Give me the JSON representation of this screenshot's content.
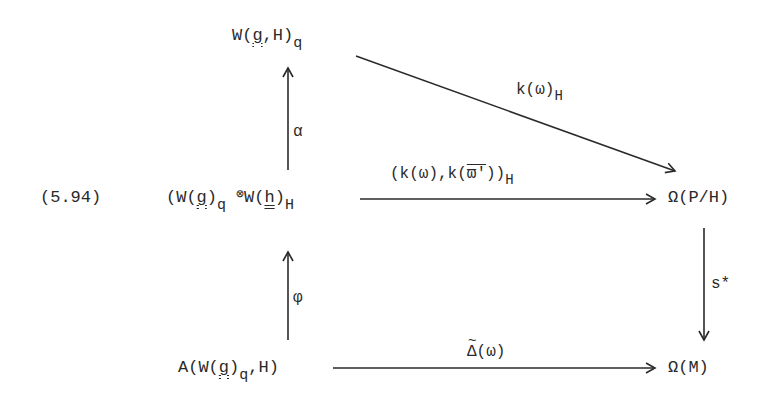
{
  "equation_number": "(5.94)",
  "nodes": {
    "top": {
      "main": "W(",
      "g": "g",
      "rest": ",H)",
      "sub": "q"
    },
    "middle_left": {
      "open": "(W(",
      "g": "g",
      "close1": ")",
      "sub1": "q",
      "tensor": "⊗",
      "w2": "W(",
      "h": "h",
      "close2": ")",
      "sub2": "H"
    },
    "middle_right": {
      "text": "Ω(P/H)"
    },
    "bottom_left": {
      "open": "A(W(",
      "g": "g",
      "close1": ")",
      "sub": "q",
      "rest": ",H)"
    },
    "bottom_right": {
      "text": "Ω(M)"
    }
  },
  "arrows": {
    "alpha": {
      "label": "α"
    },
    "phi": {
      "label": "φ"
    },
    "diagonal": {
      "label": "k(ω)",
      "sub": "H"
    },
    "middle": {
      "label": "(k(ω),k(",
      "omega_bar": "ϖ'",
      "close": "))",
      "sub": "H"
    },
    "bottom": {
      "delta": "Δ",
      "label": "(ω)"
    },
    "s_star": {
      "label": "s*"
    }
  }
}
